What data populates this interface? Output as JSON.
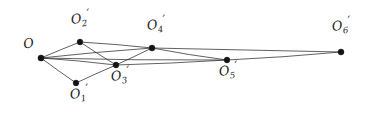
{
  "figure": {
    "type": "geometric-point-diagram",
    "width": 371,
    "height": 117,
    "background_color": "#ffffff",
    "line_color": "#2a2a2a",
    "node_color": "#141414"
  },
  "nodes": [
    {
      "id": "O",
      "base": "O",
      "sub": "",
      "prime": "",
      "x": 41,
      "y": 58,
      "r": 3.1,
      "label_x": 22,
      "label_y": 38,
      "label_rot": -12
    },
    {
      "id": "O1",
      "base": "O",
      "sub": "1",
      "prime": "′",
      "x": 76,
      "y": 83,
      "r": 2.9,
      "label_x": 69,
      "label_y": 88,
      "label_rot": -8
    },
    {
      "id": "O2",
      "base": "O",
      "sub": "2",
      "prime": "′",
      "x": 80,
      "y": 42,
      "r": 2.9,
      "label_x": 70,
      "label_y": 13,
      "label_rot": -8
    },
    {
      "id": "O3",
      "base": "O",
      "sub": "3",
      "prime": "′",
      "x": 116,
      "y": 65,
      "r": 2.9,
      "label_x": 110,
      "label_y": 70,
      "label_rot": -8
    },
    {
      "id": "O4",
      "base": "O",
      "sub": "4",
      "prime": "′",
      "x": 152,
      "y": 48,
      "r": 3.0,
      "label_x": 146,
      "label_y": 19,
      "label_rot": -8
    },
    {
      "id": "O5",
      "base": "O",
      "sub": "5",
      "prime": "′",
      "x": 227,
      "y": 60,
      "r": 2.9,
      "label_x": 218,
      "label_y": 65,
      "label_rot": -8
    },
    {
      "id": "O6",
      "base": "O",
      "sub": "6",
      "prime": "′",
      "x": 341,
      "y": 52,
      "r": 3.0,
      "label_x": 331,
      "label_y": 20,
      "label_rot": -8
    }
  ],
  "edges": [
    {
      "from": "O",
      "to": "O1"
    },
    {
      "from": "O",
      "to": "O2"
    },
    {
      "from": "O",
      "to": "O3"
    },
    {
      "from": "O",
      "to": "O4"
    },
    {
      "from": "O",
      "to": "O5"
    },
    {
      "from": "O1",
      "to": "O3"
    },
    {
      "from": "O2",
      "to": "O3"
    },
    {
      "from": "O2",
      "to": "O4"
    },
    {
      "from": "O3",
      "to": "O4"
    },
    {
      "from": "O3",
      "to": "O5"
    },
    {
      "from": "O4",
      "to": "O5"
    },
    {
      "from": "O4",
      "to": "O6"
    },
    {
      "from": "O5",
      "to": "O6"
    }
  ]
}
